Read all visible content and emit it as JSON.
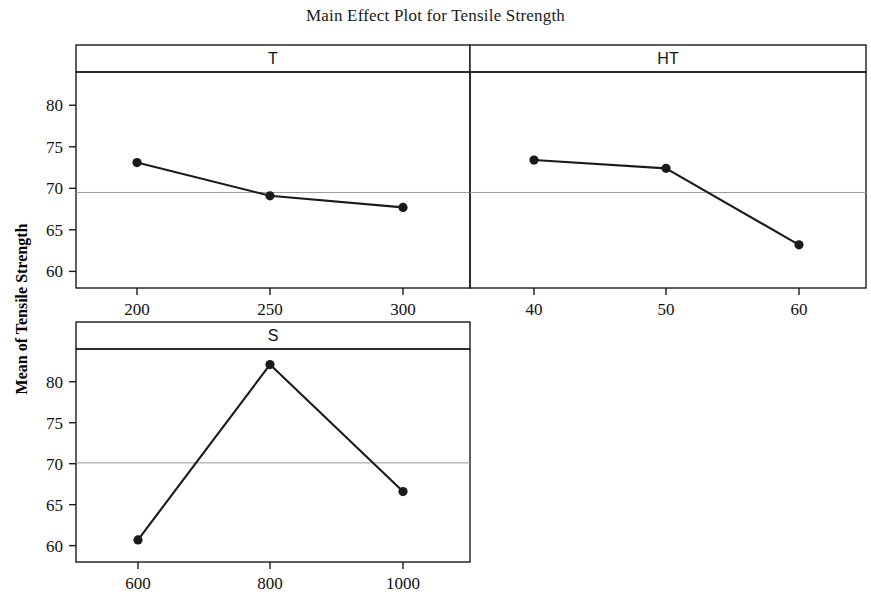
{
  "chart_data": {
    "type": "line",
    "title": "Main Effect Plot for Tensile Strength",
    "ylabel": "Mean of Tensile Strength",
    "xlabel": "",
    "grid": false,
    "legend": null,
    "layout": "3 panels: two side-by-side on top row (T, HT), one on bottom row (S)",
    "panels": [
      {
        "name": "T",
        "header": "T",
        "x": [
          200,
          250,
          300
        ],
        "xticklabels": [
          "200",
          "250",
          "300"
        ],
        "values": [
          73.1,
          69.1,
          67.7
        ],
        "ylim": [
          58.0,
          84.0
        ],
        "yticks": [
          60,
          65,
          70,
          75,
          80
        ],
        "yticklabels": [
          "60",
          "65",
          "70",
          "75",
          "80"
        ],
        "reference_line": 69.5
      },
      {
        "name": "HT",
        "header": "HT",
        "x": [
          40,
          50,
          60
        ],
        "xticklabels": [
          "40",
          "50",
          "60"
        ],
        "values": [
          73.4,
          72.4,
          63.2
        ],
        "ylim": [
          58.0,
          84.0
        ],
        "yticks": [
          60,
          65,
          70,
          75,
          80
        ],
        "yticklabels": [
          "60",
          "65",
          "70",
          "75",
          "80"
        ],
        "reference_line": 69.5
      },
      {
        "name": "S",
        "header": "S",
        "x": [
          600,
          800,
          1000
        ],
        "xticklabels": [
          "600",
          "800",
          "1000"
        ],
        "values": [
          60.7,
          82.1,
          66.6
        ],
        "ylim": [
          58.0,
          84.0
        ],
        "yticks": [
          60,
          65,
          70,
          75,
          80
        ],
        "yticklabels": [
          "60",
          "65",
          "70",
          "75",
          "80"
        ],
        "reference_line": 70.1
      }
    ],
    "series_color": "#1a1a1a",
    "marker": "filled-circle",
    "reference_line_color": "#9a9a9a"
  },
  "figure": {
    "title": "Main Effect Plot for Tensile Strength",
    "ylabel": "Mean of Tensile Strength"
  }
}
